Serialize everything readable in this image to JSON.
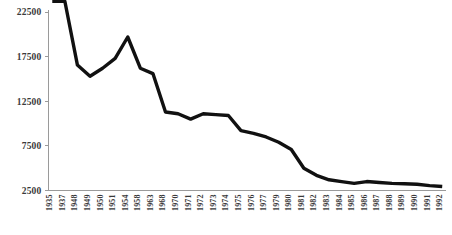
{
  "chart_data": {
    "type": "line",
    "title": "",
    "subtitle": "",
    "xlabel": "",
    "ylabel": "",
    "grid": false,
    "legend": null,
    "legend_position": "none",
    "line_color": "#111111",
    "axis_color": "#9a9a9a",
    "label_color": "#3a3a3a",
    "ylim": [
      2500,
      22500
    ],
    "ytick_values": [
      22500,
      17500,
      12500,
      7500,
      2500
    ],
    "ytick_labels": [
      "22500",
      "17500",
      "12500",
      "7500",
      "2500"
    ],
    "categories": [
      "1935",
      "1937",
      "1948",
      "1949",
      "1950",
      "1951",
      "1954",
      "1958",
      "1963",
      "1968",
      "1970",
      "1971",
      "1972",
      "1973",
      "1974",
      "1975",
      "1976",
      "1977",
      "1979",
      "1980",
      "1981",
      "1982",
      "1983",
      "1984",
      "1985",
      "1986",
      "1987",
      "1988",
      "1989",
      "1990",
      "1991",
      "1992"
    ],
    "values": [
      23700,
      23700,
      16550,
      15300,
      16200,
      17300,
      19700,
      16200,
      15600,
      11300,
      11100,
      10500,
      11100,
      11000,
      10900,
      9200,
      8900,
      8500,
      7900,
      7100,
      5000,
      4200,
      3700,
      3500,
      3300,
      3500,
      3400,
      3300,
      3250,
      3200,
      3050,
      2950
    ]
  }
}
